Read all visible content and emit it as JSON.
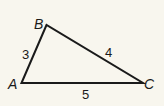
{
  "diagram": {
    "type": "triangle",
    "background": "#f8f6ee",
    "stroke_color": "#1a1a1a",
    "vertices": [
      {
        "name": "A",
        "x": 21.5,
        "y": 83
      },
      {
        "name": "B",
        "x": 46.5,
        "y": 25
      },
      {
        "name": "C",
        "x": 143,
        "y": 83
      }
    ],
    "vertex_labels": {
      "A": "A",
      "B": "B",
      "C": "C"
    },
    "side_labels": {
      "AB": "3",
      "BC": "4",
      "AC": "5"
    }
  }
}
